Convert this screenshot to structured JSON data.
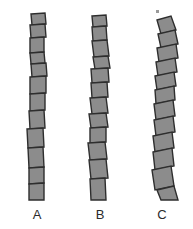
{
  "figure": {
    "width": 193,
    "height": 229,
    "background_color": "#ffffff",
    "segment_fill_color": "#8c8c8c",
    "segment_stroke_color": "#2e2e2e",
    "label_color": "#2b2b2b",
    "speck_color": "#9a9a9a",
    "type": "diagram"
  },
  "labels": {
    "a": "A",
    "b": "B",
    "c": "C"
  },
  "columns": [
    {
      "id": "a",
      "label": "A",
      "center_x": 37,
      "tilt_level": "low",
      "segment_count": 10,
      "segments": [
        {
          "points": "31,14 45,13 46,24 32,25",
          "tilt": -4
        },
        {
          "points": "30,25 45,24 46,37 31,38",
          "tilt": -4
        },
        {
          "points": "30,38 44,37 44,52 30,53",
          "tilt": -3
        },
        {
          "points": "30,53 44,52 45,63 31,64",
          "tilt": -4
        },
        {
          "points": "31,64 46,63 47,76 32,77",
          "tilt": -4
        },
        {
          "points": "30,77 46,76 46,93 30,94",
          "tilt": -3
        },
        {
          "points": "30,94 45,93 45,110 30,111",
          "tilt": -3
        },
        {
          "points": "29,111 44,110 45,128 30,129",
          "tilt": -3
        },
        {
          "points": "27,129 43,128 44,147 28,148",
          "tilt": -4
        },
        {
          "points": "28,148 43,147 44,167 29,168",
          "tilt": -4
        },
        {
          "points": "29,168 44,167 44,183 29,184",
          "tilt": -3
        },
        {
          "points": "29,184 44,183 44,200 29,200",
          "tilt": 0
        }
      ]
    },
    {
      "id": "b",
      "label": "B",
      "center_x": 99,
      "tilt_level": "medium",
      "segment_count": 11,
      "segments": [
        {
          "points": "92,16 106,15 107,26 93,27",
          "tilt": -5
        },
        {
          "points": "92,27 106,26 107,40 93,41",
          "tilt": -5
        },
        {
          "points": "92,41 107,40 109,56 94,57",
          "tilt": -6
        },
        {
          "points": "93,57 108,56 110,68 95,69",
          "tilt": -7
        },
        {
          "points": "91,69 108,68 109,82 92,83",
          "tilt": -5
        },
        {
          "points": "91,83 107,82 108,97 92,98",
          "tilt": -5
        },
        {
          "points": "90,98 106,97 108,113 92,114",
          "tilt": -6
        },
        {
          "points": "89,114 106,113 108,127 91,128",
          "tilt": -6
        },
        {
          "points": "90,128 106,127 106,142 90,143",
          "tilt": -4
        },
        {
          "points": "88,143 105,142 107,159 90,160",
          "tilt": -6
        },
        {
          "points": "89,160 106,159 108,178 91,179",
          "tilt": -6
        },
        {
          "points": "90,179 105,178 106,200 91,200",
          "tilt": -4
        }
      ]
    },
    {
      "id": "c",
      "label": "C",
      "center_x": 162,
      "tilt_level": "high",
      "segment_count": 11,
      "segments": [
        {
          "points": "157,20 171,16 176,30 161,34",
          "tilt": -16
        },
        {
          "points": "158,34 175,30 178,44 161,48",
          "tilt": -14
        },
        {
          "points": "157,48 176,44 178,58 159,62",
          "tilt": -13
        },
        {
          "points": "156,62 175,58 177,72 158,76",
          "tilt": -13
        },
        {
          "points": "155,76 174,72 176,86 157,90",
          "tilt": -13
        },
        {
          "points": "155,90 174,86 175,100 156,104",
          "tilt": -12
        },
        {
          "points": "154,104 173,100 175,116 156,120",
          "tilt": -13
        },
        {
          "points": "154,120 173,116 175,132 156,136",
          "tilt": -13
        },
        {
          "points": "153,136 172,132 174,148 155,152",
          "tilt": -13
        },
        {
          "points": "153,152 172,148 174,166 155,170",
          "tilt": -13
        },
        {
          "points": "152,170 171,166 174,186 155,190",
          "tilt": -13
        },
        {
          "points": "157,190 174,186 178,200 161,200",
          "tilt": -13
        }
      ]
    }
  ],
  "speck": {
    "x": 156,
    "y": 10,
    "size": 3,
    "name": "stray-speck"
  }
}
